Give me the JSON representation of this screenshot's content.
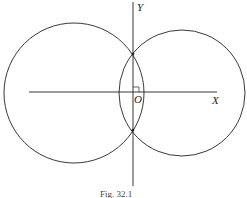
{
  "figure": {
    "labels": {
      "y_axis": "Y",
      "x_axis": "X",
      "origin": "O"
    },
    "caption": "Fig. 32.1",
    "stroke_color": "#222222"
  }
}
